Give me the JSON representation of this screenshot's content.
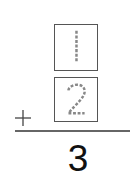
{
  "problem": {
    "operator": "+",
    "addend_top": "1",
    "addend_bottom": "2",
    "answer": "3",
    "digit_style": "dotted-tracing"
  },
  "colors": {
    "box_border": "#555555",
    "trace_digit": "#888888",
    "rule": "#666666",
    "answer": "#111111"
  },
  "icons": {
    "plus": "plus-icon"
  }
}
